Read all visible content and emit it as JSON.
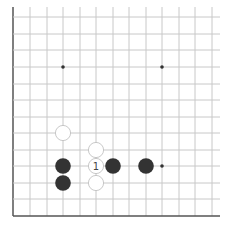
{
  "board": {
    "description": "Go board corner diagram (lower-left), partial view",
    "grid": {
      "x_lines": [
        13,
        30,
        47,
        63,
        80,
        96,
        113,
        129,
        146,
        162,
        179,
        195,
        212
      ],
      "y_lines": [
        17,
        34,
        50,
        67,
        84,
        100,
        117,
        133,
        150,
        166,
        183,
        199,
        216
      ],
      "left_edge_x": 13,
      "bottom_edge_y": 216,
      "line_color": "#c8c8c8",
      "edge_color": "#555555"
    },
    "star_points": [
      {
        "x": 63,
        "y": 67
      },
      {
        "x": 162,
        "y": 67
      },
      {
        "x": 162,
        "y": 166
      }
    ],
    "stones": [
      {
        "color": "white",
        "x": 63,
        "y": 133,
        "label": ""
      },
      {
        "color": "white",
        "x": 96,
        "y": 150,
        "label": ""
      },
      {
        "color": "white",
        "x": 96,
        "y": 166,
        "label": "1"
      },
      {
        "color": "black",
        "x": 63,
        "y": 166,
        "label": ""
      },
      {
        "color": "black",
        "x": 113,
        "y": 166,
        "label": ""
      },
      {
        "color": "black",
        "x": 146,
        "y": 166,
        "label": ""
      },
      {
        "color": "black",
        "x": 63,
        "y": 183,
        "label": ""
      },
      {
        "color": "white",
        "x": 96,
        "y": 183,
        "label": ""
      }
    ],
    "colors": {
      "black_stone": "#333333",
      "white_stone_fill": "#ffffff",
      "white_stone_stroke": "#bbbbbb",
      "label": "#444444"
    }
  }
}
